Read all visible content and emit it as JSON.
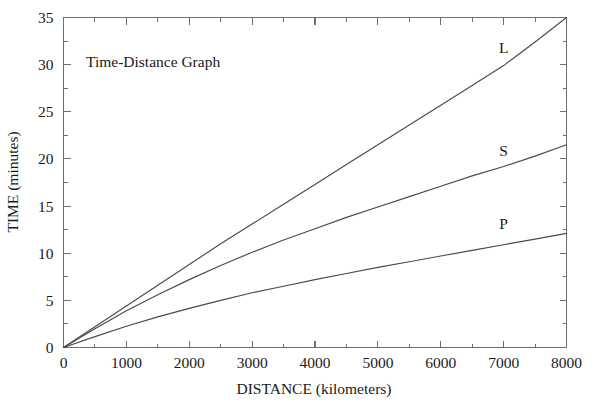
{
  "chart_data": {
    "type": "line",
    "title": "Time-Distance Graph",
    "xlabel": "DISTANCE (kilometers)",
    "ylabel": "TIME (minutes)",
    "xlim": [
      0,
      8000
    ],
    "ylim": [
      0,
      35
    ],
    "grid": false,
    "legend_position": "inline-curve-labels",
    "x_ticks": [
      0,
      1000,
      2000,
      3000,
      4000,
      5000,
      6000,
      7000,
      8000
    ],
    "x_tick_labels": [
      "0",
      "1000",
      "2000",
      "3000",
      "4000",
      "5000",
      "6000",
      "7000",
      "8000"
    ],
    "x_minor_step": 500,
    "y_ticks": [
      0,
      5,
      10,
      15,
      20,
      25,
      30,
      35
    ],
    "y_tick_labels": [
      "0",
      "5",
      "10",
      "15",
      "20",
      "25",
      "30",
      "35"
    ],
    "y_minor_step": 2.5,
    "x": [
      0,
      500,
      1000,
      1500,
      2000,
      2500,
      3000,
      3500,
      4000,
      4500,
      5000,
      5500,
      6000,
      6500,
      7000,
      7500,
      8000
    ],
    "series": [
      {
        "name": "L",
        "label": "L",
        "label_x": 7000,
        "label_y": 31.2,
        "values": [
          0,
          2.2,
          4.4,
          6.6,
          8.8,
          11.0,
          13.1,
          15.2,
          17.3,
          19.4,
          21.5,
          23.6,
          25.7,
          27.8,
          29.9,
          32.4,
          35.0
        ]
      },
      {
        "name": "S",
        "label": "S",
        "label_x": 7000,
        "label_y": 20.3,
        "values": [
          0,
          2.0,
          3.9,
          5.6,
          7.2,
          8.7,
          10.1,
          11.4,
          12.6,
          13.8,
          14.9,
          16.0,
          17.1,
          18.2,
          19.2,
          20.3,
          21.5
        ]
      },
      {
        "name": "P",
        "label": "P",
        "label_x": 7000,
        "label_y": 12.6,
        "values": [
          0,
          1.15,
          2.25,
          3.25,
          4.15,
          5.0,
          5.8,
          6.5,
          7.2,
          7.85,
          8.5,
          9.1,
          9.7,
          10.3,
          10.9,
          11.5,
          12.1
        ]
      }
    ]
  },
  "colors": {
    "axis": "#6f6f6f",
    "curve": "#4a4a4a",
    "text": "#1a1a1a",
    "background": "#ffffff"
  }
}
